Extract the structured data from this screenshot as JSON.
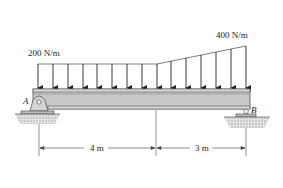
{
  "diagram": {
    "type": "simply supported beam with distributed load",
    "load_left_label": "200 N/m",
    "load_right_label": "400 N/m",
    "support_left_label": "A",
    "support_right_label": "B",
    "dim_left_label": "4 m",
    "dim_right_label": "3 m",
    "support_left_type": "pin",
    "support_right_type": "roller",
    "load_profile": [
      {
        "segment": "uniform",
        "from_m": 0,
        "to_m": 4,
        "intensity_start": "200 N/m",
        "intensity_end": "200 N/m"
      },
      {
        "segment": "linearly varying",
        "from_m": 4,
        "to_m": 7,
        "intensity_start": "200 N/m",
        "intensity_end": "400 N/m"
      }
    ],
    "colors": {
      "beam_fill": "#c9c9c9",
      "beam_edge": "#555555",
      "line": "#222222",
      "ground": "#bdbdbd"
    }
  }
}
